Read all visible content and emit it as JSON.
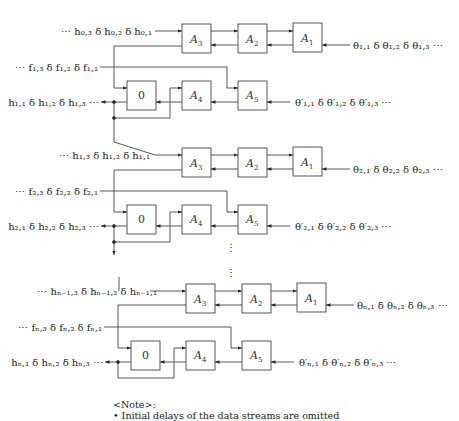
{
  "diagram": {
    "type": "systolic-array-dataflow",
    "blocks": [
      "A1",
      "A2",
      "A3",
      "A4",
      "A5",
      "0"
    ],
    "rows": [
      {
        "id": "row-1",
        "h_in": "⋯ h₀,₃ δ h₀,₂ δ h₀,₁",
        "f_in": "⋯ f₁,₃ δ f₁,₂ δ f₁,₁",
        "h_out": "h₁,₁ δ h₁,₂ δ h₁,₃ ⋯",
        "theta_in": "θ₁,₁ δ θ₁,₂ δ θ₁,₃ ⋯",
        "theta_prime_in": "θ′₁,₁ δ θ′₁,₂ δ θ′₁,₃ ⋯"
      },
      {
        "id": "row-2",
        "h_in": "⋯ h₁,₃ δ h₁,₂ δ h₁,₁",
        "f_in": "⋯ f₂,₃ δ f₂,₂ δ f₂,₁",
        "h_out": "h₂,₁ δ h₂,₂ δ h₂,₃ ⋯",
        "theta_in": "θ₂,₁ δ θ₂,₂ δ θ₂,₃ ⋯",
        "theta_prime_in": "θ′₂,₁ δ θ′₂,₂ δ θ′₂,₃ ⋯"
      },
      {
        "id": "row-n",
        "h_in": "⋯ hₙ₋₁,₃ δ hₙ₋₁,₂ δ hₙ₋₁,₁",
        "f_in": "⋯ fₙ,₃ δ fₙ,₂ δ fₙ,₁",
        "h_out": "hₙ,₁ δ hₙ,₂ δ hₙ,₃ ⋯",
        "theta_in": "θₙ,₁ δ θₙ,₂ δ θₙ,₃ ⋯",
        "theta_prime_in": "θ′ₙ,₁ δ θ′ₙ,₂ δ θ′ₙ,₃ ⋯"
      }
    ],
    "box_labels": {
      "a1": "A",
      "a1_sub": "1",
      "a2": "A",
      "a2_sub": "2",
      "a3": "A",
      "a3_sub": "3",
      "a4": "A",
      "a4_sub": "4",
      "a5": "A",
      "a5_sub": "5",
      "zero": "0"
    },
    "ellipsis": "⋮"
  },
  "note": {
    "title": "<Note>:",
    "bullet": "• Initial delays of the data streams are omitted"
  }
}
